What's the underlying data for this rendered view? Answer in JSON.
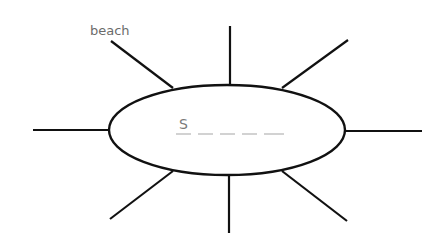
{
  "diagram": {
    "type": "spider-diagram",
    "center": {
      "first_letter": "S",
      "blank_count": 5,
      "shape": "ellipse",
      "cx": 227,
      "cy": 130,
      "rx": 118,
      "ry": 45
    },
    "spokes": [
      {
        "position": "upper-left",
        "label": "beach",
        "x1": 173,
        "y1": 88,
        "x2": 111,
        "y2": 41
      },
      {
        "position": "top",
        "label": "",
        "x1": 230,
        "y1": 84,
        "x2": 230,
        "y2": 26
      },
      {
        "position": "upper-right",
        "label": "",
        "x1": 282,
        "y1": 88,
        "x2": 348,
        "y2": 40
      },
      {
        "position": "right",
        "label": "",
        "x1": 346,
        "y1": 131,
        "x2": 422,
        "y2": 131
      },
      {
        "position": "lower-right",
        "label": "",
        "x1": 282,
        "y1": 171,
        "x2": 347,
        "y2": 221
      },
      {
        "position": "bottom",
        "label": "",
        "x1": 229,
        "y1": 176,
        "x2": 229,
        "y2": 233
      },
      {
        "position": "lower-left",
        "label": "",
        "x1": 173,
        "y1": 171,
        "x2": 110,
        "y2": 219
      },
      {
        "position": "left",
        "label": "",
        "x1": 33,
        "y1": 130,
        "x2": 109,
        "y2": 130
      }
    ],
    "colors": {
      "line": "#111111",
      "label_text": "#6b6b6b",
      "blank_dash": "#b5b5b5",
      "background": "#ffffff"
    }
  }
}
